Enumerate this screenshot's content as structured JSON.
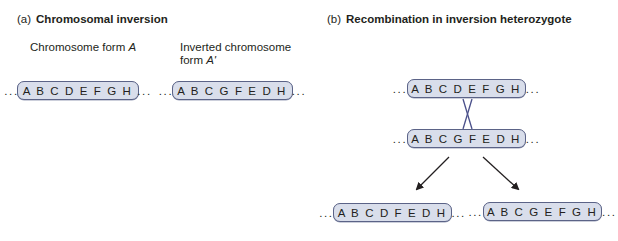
{
  "panel_a": {
    "label": "(a)",
    "title": "Chromosomal inversion",
    "form_a_caption": "Chromosome form ",
    "form_a_italic": "A",
    "form_a2_caption_line1": "Inverted chromosome",
    "form_a2_caption_line2": "form ",
    "form_a2_italic": "A'",
    "chromosome_a": "... A B C D E F G H ...",
    "chromosome_a2": "... A B C G F E D H ..."
  },
  "panel_b": {
    "label": "(b)",
    "title": "Recombination in inversion heterozygote",
    "top_chromosome": "... A B C D E F G H ...",
    "bottom_chromosome": "... A B C G F E D H ...",
    "product_left": "... A B C D F E D H ...",
    "product_right": "... A B C G E F G H ..."
  },
  "colors": {
    "chromosome_fill": "#d9deeb",
    "chromosome_border": "#5b6387",
    "crossover_line": "#4a4f8a",
    "arrow": "#231f20"
  }
}
